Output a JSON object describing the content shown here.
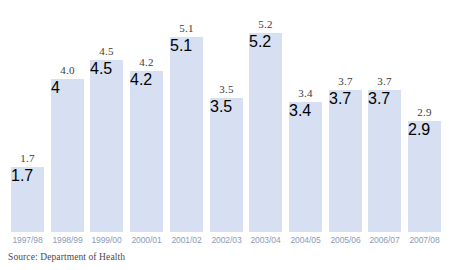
{
  "chart_data": {
    "type": "bar",
    "title": "",
    "subtitle": "",
    "xlabel": "",
    "ylabel": "",
    "ylim": [
      0,
      5.2
    ],
    "grid": false,
    "legend": null,
    "bar_color": "#d7e0f2",
    "value_label_color": "#3b3b3b",
    "tick_label_color": "#8c9bb6",
    "background_color": "#ffffff",
    "categories": [
      "1997/98",
      "1998/99",
      "1999/00",
      "2000/01",
      "2001/02",
      "2002/03",
      "2003/04",
      "2004/05",
      "2005/06",
      "2006/07",
      "2007/08"
    ],
    "values": [
      1.7,
      4.0,
      4.5,
      4.2,
      5.1,
      3.5,
      5.2,
      3.4,
      3.7,
      3.7,
      2.9
    ],
    "value_labels": [
      "1.7",
      "4.0",
      "4.5",
      "4.2",
      "5.1",
      "3.5",
      "5.2",
      "3.4",
      "3.7",
      "3.7",
      "2.9"
    ]
  },
  "source": {
    "text": "Source: Department of Health"
  }
}
